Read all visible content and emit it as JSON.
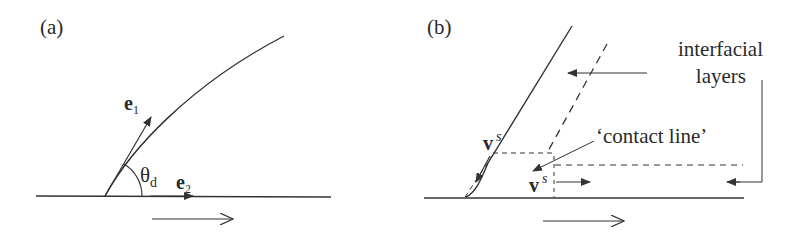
{
  "panels": [
    {
      "id": "a",
      "label": "(a)",
      "vectors": {
        "e1": {
          "symbol": "e",
          "subscript": "1"
        },
        "e2": {
          "symbol": "e",
          "subscript": "2"
        }
      },
      "angle": {
        "symbol": "θ",
        "subscript": "d"
      }
    },
    {
      "id": "b",
      "label": "(b)",
      "annotations": {
        "interfacial_line1": "interfacial",
        "interfacial_line2": "layers",
        "contact_line": "‘contact line’"
      },
      "velocities": {
        "upper": {
          "symbol": "v",
          "superscript": "s"
        },
        "lower": {
          "symbol": "v",
          "superscript": "s"
        }
      }
    }
  ],
  "colors": {
    "stroke": "#333333",
    "text": "#2a2a2a",
    "background": "#ffffff"
  }
}
